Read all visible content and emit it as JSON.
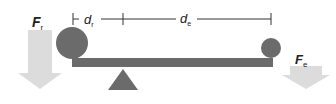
{
  "diagram": {
    "type": "lever",
    "colors": {
      "beam": "#6b6b6b",
      "mass": "#6b6b6b",
      "fulcrum": "#6b6b6b",
      "force_arrow": "#dcdcdc",
      "dimension_line": "#333333",
      "text": "#222222"
    },
    "labels": {
      "resistance_force": {
        "main": "F",
        "sub": "r"
      },
      "effort_force": {
        "main": "F",
        "sub": "e"
      },
      "resistance_distance": {
        "main": "d",
        "sub": "r"
      },
      "effort_distance": {
        "main": "d",
        "sub": "e"
      }
    }
  }
}
